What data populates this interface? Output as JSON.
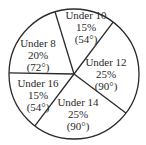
{
  "chart_data": {
    "type": "pie",
    "title": "",
    "center": [
      74,
      74
    ],
    "radius": 65,
    "start_angle_deg": 107,
    "direction": "counterclockwise",
    "slices": [
      {
        "label": "Under 8",
        "percent": "20%",
        "degrees": "(72°)",
        "value": 20,
        "angle": 72
      },
      {
        "label": "Under 16",
        "percent": "15%",
        "degrees": "(54°)",
        "value": 15,
        "angle": 54
      },
      {
        "label": "Under 14",
        "percent": "25%",
        "degrees": "(90°)",
        "value": 25,
        "angle": 90
      },
      {
        "label": "Under 12",
        "percent": "25%",
        "degrees": "(90°)",
        "value": 25,
        "angle": 90
      },
      {
        "label": "Under 10",
        "percent": "15%",
        "degrees": "(54°)",
        "value": 15,
        "angle": 54
      }
    ],
    "label_positions": [
      {
        "x": 38,
        "y": 47
      },
      {
        "x": 38,
        "y": 87
      },
      {
        "x": 78,
        "y": 106
      },
      {
        "x": 106,
        "y": 66
      },
      {
        "x": 86,
        "y": 19
      }
    ],
    "colors": {
      "fill": "#ffffff",
      "stroke": "#2a2a2a",
      "text": "#2a2a2a"
    }
  }
}
